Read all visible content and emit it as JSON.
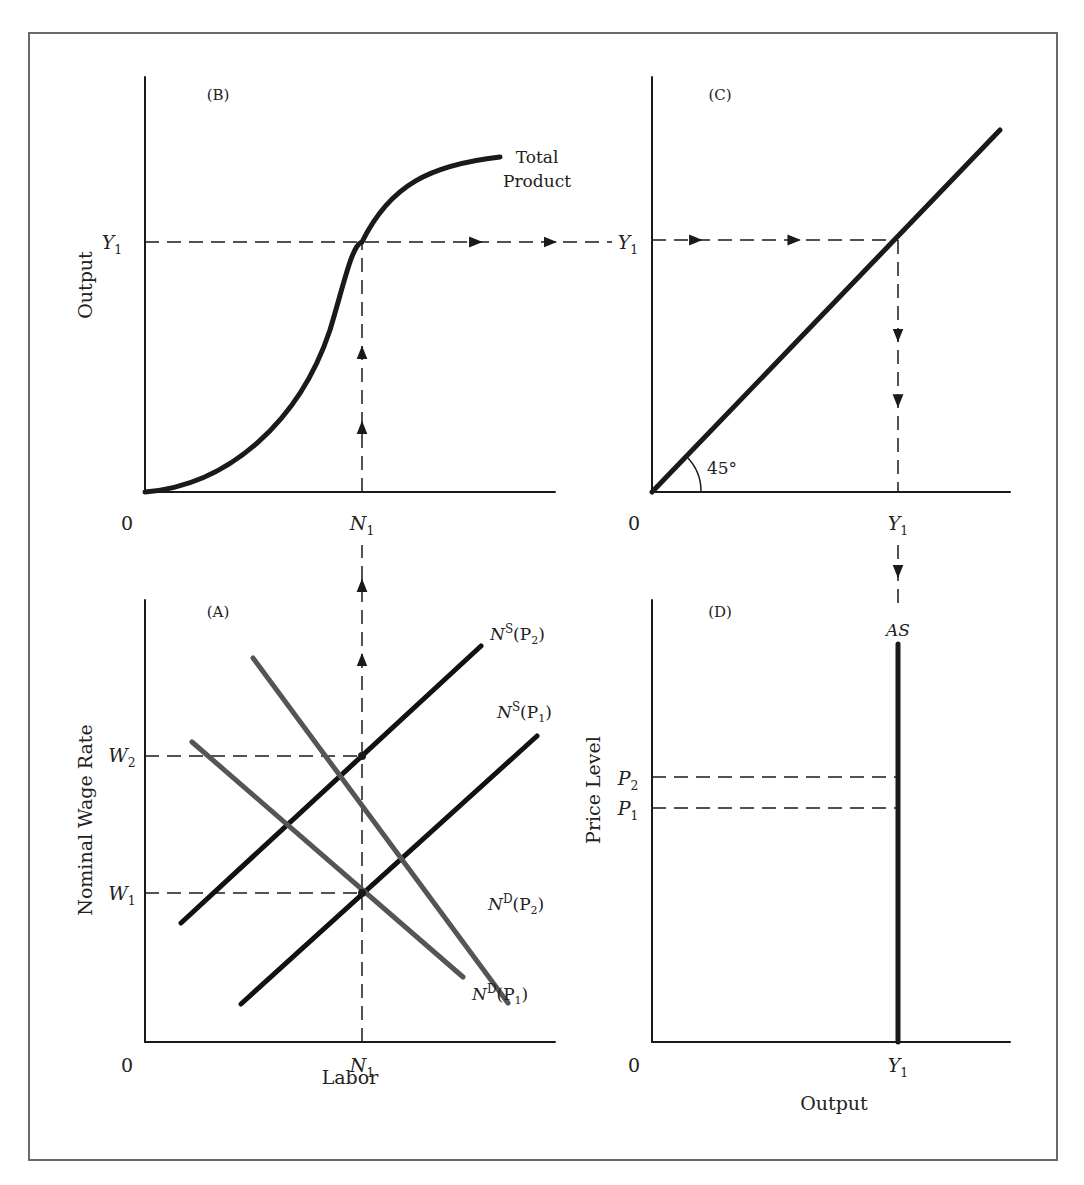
{
  "figure": {
    "border": {
      "x": 29,
      "y": 33,
      "w": 1028,
      "h": 1127,
      "color": "#6a6a6a"
    },
    "ink": "#1a1a1a",
    "gray_curve": "#555555"
  },
  "panels": {
    "B": {
      "tag": "(B)",
      "origin": [
        145,
        492
      ],
      "x_axis_end": 555,
      "y_axis_top": 77,
      "y_title": "Output",
      "origin_label": "0",
      "x_tick": {
        "label": "N",
        "sub": "1",
        "x": 362
      },
      "y_tick": {
        "label": "Y",
        "sub": "1",
        "y": 242
      },
      "curve_label_lines": [
        "Total",
        "Product"
      ],
      "curve_path": "M145,492 C230,485 300,420 330,330 C345,280 352,245 362,242 C390,185 430,165 500,157"
    },
    "C": {
      "tag": "(C)",
      "origin": [
        652,
        492
      ],
      "x_axis_end": 1010,
      "y_axis_top": 77,
      "origin_label": "0",
      "x_tick": {
        "label": "Y",
        "sub": "1",
        "x": 898
      },
      "y_tick": {
        "label": "Y",
        "sub": "1",
        "y": 240
      },
      "angle_label": "45°",
      "line_end": [
        1000,
        130
      ]
    },
    "A": {
      "tag": "(A)",
      "origin": [
        145,
        1042
      ],
      "x_axis_end": 555,
      "y_axis_top": 600,
      "y_title": "Nominal Wage Rate",
      "x_title": "Labor",
      "origin_label": "0",
      "x_tick": {
        "label": "N",
        "sub": "1",
        "x": 362
      },
      "w2": {
        "label": "W",
        "sub": "2",
        "y": 756
      },
      "w1": {
        "label": "W",
        "sub": "1",
        "y": 893
      },
      "curves": [
        {
          "name": "NS(P2)",
          "base": "N",
          "sup": "S",
          "arg": "P",
          "argsub": "2",
          "from": [
            181,
            923
          ],
          "to": [
            481,
            646
          ],
          "color": "#111111",
          "label_xy": [
            490,
            640
          ]
        },
        {
          "name": "NS(P1)",
          "base": "N",
          "sup": "S",
          "arg": "P",
          "argsub": "1",
          "from": [
            241,
            1004
          ],
          "to": [
            537,
            736
          ],
          "color": "#111111",
          "label_xy": [
            497,
            718
          ]
        },
        {
          "name": "ND(P2)",
          "base": "N",
          "sup": "D",
          "arg": "P",
          "argsub": "2",
          "from": [
            253,
            658
          ],
          "to": [
            508,
            1003
          ],
          "color": "#555555",
          "label_xy": [
            488,
            910
          ]
        },
        {
          "name": "ND(P1)",
          "base": "N",
          "sup": "D",
          "arg": "P",
          "argsub": "1",
          "from": [
            192,
            742
          ],
          "to": [
            463,
            977
          ],
          "color": "#555555",
          "label_xy": [
            472,
            1000
          ]
        }
      ]
    },
    "D": {
      "tag": "(D)",
      "origin": [
        652,
        1042
      ],
      "x_axis_end": 1010,
      "y_axis_top": 600,
      "y_title": "Price Level",
      "x_title": "Output",
      "origin_label": "0",
      "x_tick": {
        "label": "Y",
        "sub": "1",
        "x": 898
      },
      "p2": {
        "label": "P",
        "sub": "2",
        "y": 777
      },
      "p1": {
        "label": "P",
        "sub": "1",
        "y": 808
      },
      "as_label": "AS",
      "as_top": 644
    }
  }
}
